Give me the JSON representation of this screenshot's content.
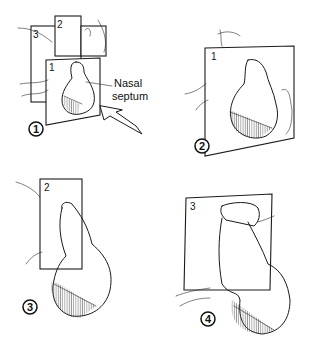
{
  "figure": {
    "panels": [
      {
        "step": "1",
        "plane_labels": [
          "1",
          "2",
          "3"
        ],
        "annotation": {
          "line1": "Nasal",
          "line2": "septum"
        }
      },
      {
        "step": "2",
        "plane_labels": [
          "1"
        ]
      },
      {
        "step": "3",
        "plane_labels": [
          "2"
        ]
      },
      {
        "step": "4",
        "plane_labels": [
          "3"
        ]
      }
    ]
  }
}
